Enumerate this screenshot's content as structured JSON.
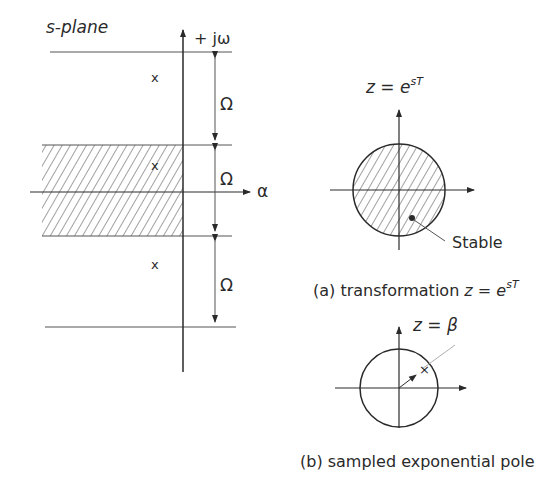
{
  "s_plane": {
    "title": "s-plane",
    "jw_axis_label": "+ jω",
    "sigma_axis_label": "α",
    "strip_width_label": "Ω",
    "pole_marker": "x",
    "strip_labels": [
      "Ω",
      "Ω",
      "Ω"
    ]
  },
  "z_transform": {
    "equation_prefix": "z = e",
    "equation_exponent": "sT",
    "stable_label": "Stable",
    "caption_prefix": "(a) transformation ",
    "caption_eq": "z = e",
    "caption_exp": "sT"
  },
  "sampled_pole": {
    "equation": "z = β",
    "pole_marker": "×",
    "caption": "(b) sampled exponential pole"
  },
  "colors": {
    "ink": "#2a2a2a",
    "background": "#ffffff"
  }
}
